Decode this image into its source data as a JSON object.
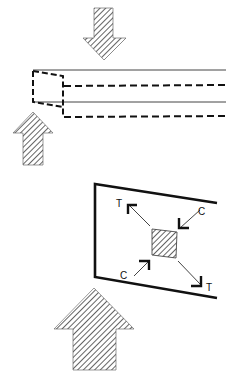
{
  "diagram": {
    "colors": {
      "ink": "#111111",
      "hatch": "#222222",
      "background": "#ffffff"
    },
    "beam_figure": {
      "top_arrow": {
        "direction": "down",
        "icon": "hatched-arrow-down"
      },
      "bottom_arrow": {
        "direction": "up",
        "icon": "hatched-arrow-up"
      },
      "beam": {
        "solid_lines": 2,
        "dashed_lines": 2,
        "deformed_end": "dashed-trapezoid"
      }
    },
    "plate_figure": {
      "labels": {
        "tension_top_left": "T",
        "compression_top_right": "C",
        "compression_bottom_left": "C",
        "tension_bottom_right": "T"
      },
      "center_element": "hatched-square",
      "load_arrow": {
        "direction": "up",
        "icon": "hatched-arrow-up-large"
      }
    }
  }
}
